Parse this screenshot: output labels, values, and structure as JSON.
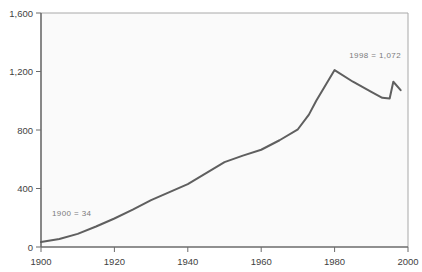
{
  "chart_data": {
    "type": "line",
    "title": "",
    "subtitle": "",
    "xlabel": "",
    "ylabel": "",
    "xlim": [
      1900,
      2000
    ],
    "ylim": [
      0,
      1600
    ],
    "grid": false,
    "legend": "none",
    "x_ticks": [
      "1900",
      "1920",
      "1940",
      "1960",
      "1980",
      "2000"
    ],
    "x_tick_values": [
      1900,
      1920,
      1940,
      1960,
      1980,
      2000
    ],
    "y_ticks": [
      "0",
      "400",
      "800",
      "1,200",
      "1,600"
    ],
    "y_tick_values": [
      0,
      400,
      800,
      1200,
      1600
    ],
    "series": [
      {
        "name": "series-1",
        "color": "#5f5f5f",
        "x": [
          1900,
          1905,
          1910,
          1915,
          1920,
          1925,
          1930,
          1935,
          1940,
          1945,
          1950,
          1955,
          1960,
          1965,
          1970,
          1973,
          1975,
          1980,
          1985,
          1990,
          1993,
          1995,
          1996,
          1998
        ],
        "values": [
          34,
          55,
          90,
          140,
          195,
          255,
          320,
          375,
          430,
          505,
          580,
          625,
          665,
          730,
          805,
          905,
          1000,
          1210,
          1130,
          1060,
          1020,
          1015,
          1130,
          1072
        ]
      }
    ],
    "annotations": [
      {
        "name": "start-value-label",
        "text": "1900 = 34",
        "x": 1903,
        "y": 215,
        "align": "left"
      },
      {
        "name": "end-value-label",
        "text": "1998 = 1,072",
        "x": 1984,
        "y": 1290,
        "align": "left"
      }
    ]
  },
  "axes": {
    "axis_color": "#6b6b6b",
    "plot_background": "#fafafa",
    "frame_color": "#9a9a9a"
  }
}
